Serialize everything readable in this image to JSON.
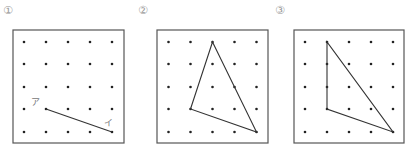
{
  "panels": [
    {
      "label": "①",
      "label_pos": [
        3,
        14
      ],
      "box": {
        "x": 13,
        "y": 30,
        "w": 111,
        "h": 113
      },
      "grid": {
        "cols": [
          24,
          46,
          68,
          90,
          112
        ],
        "rows": [
          42,
          64,
          87,
          109,
          132
        ]
      },
      "shape": {
        "type": "segment",
        "points": [
          [
            1,
            3
          ],
          [
            4,
            4
          ]
        ]
      },
      "point_labels": [
        {
          "text": "ア",
          "at": [
            31,
            105
          ]
        },
        {
          "text": "イ",
          "at": [
            104,
            126
          ]
        }
      ]
    },
    {
      "label": "②",
      "label_pos": [
        138,
        14
      ],
      "box": {
        "x": 157,
        "y": 30,
        "w": 111,
        "h": 113
      },
      "grid": {
        "cols": [
          168.5,
          190.5,
          212.5,
          234.5,
          256.5
        ],
        "rows": [
          42,
          64,
          87,
          109,
          132
        ]
      },
      "shape": {
        "type": "triangle",
        "points": [
          [
            2,
            0
          ],
          [
            1,
            3
          ],
          [
            4,
            4
          ]
        ]
      },
      "point_labels": []
    },
    {
      "label": "③",
      "label_pos": [
        275,
        14
      ],
      "box": {
        "x": 294,
        "y": 30,
        "w": 110,
        "h": 113
      },
      "grid": {
        "cols": [
          305,
          327,
          349,
          371,
          393
        ],
        "rows": [
          42,
          64,
          87,
          109,
          132
        ]
      },
      "shape": {
        "type": "triangle",
        "points": [
          [
            1,
            0
          ],
          [
            1,
            3
          ],
          [
            4,
            4
          ]
        ]
      },
      "point_labels": []
    }
  ],
  "colors": {
    "frame": "#555555",
    "dot": "#222222",
    "line": "#333333",
    "label": "#999999"
  }
}
